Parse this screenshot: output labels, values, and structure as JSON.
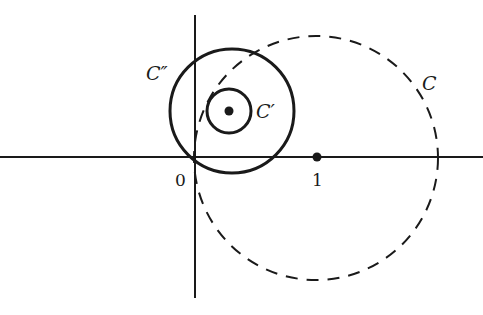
{
  "diagram": {
    "type": "complex-plane-circles",
    "axes": {
      "origin_label": "0",
      "unit_label": "1"
    },
    "circles": [
      {
        "id": "C",
        "label": "C",
        "style": "dashed",
        "description": "circle through origin centered at 1"
      },
      {
        "id": "C_double_prime",
        "label": "C″",
        "style": "solid",
        "description": "large solid circle tangent region near origin"
      },
      {
        "id": "C_prime",
        "label": "C′",
        "style": "solid",
        "description": "small solid circle around center point"
      }
    ],
    "points": [
      {
        "id": "center-point",
        "label": ""
      },
      {
        "id": "unit-point",
        "label": "1"
      }
    ],
    "colors": {
      "ink": "#1a1a1a",
      "background": "#ffffff"
    }
  }
}
